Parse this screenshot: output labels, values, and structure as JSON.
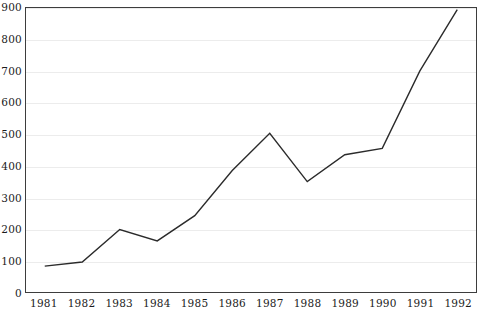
{
  "chart_data": {
    "type": "line",
    "title": "",
    "subtitle": "",
    "xlabel": "",
    "ylabel": "",
    "categories": [
      "1981",
      "1982",
      "1983",
      "1984",
      "1985",
      "1986",
      "1987",
      "1988",
      "1989",
      "1990",
      "1991",
      "1992"
    ],
    "x": [
      1981,
      1982,
      1983,
      1984,
      1985,
      1986,
      1987,
      1988,
      1989,
      1990,
      1991,
      1992
    ],
    "values": [
      82,
      95,
      198,
      162,
      242,
      385,
      503,
      350,
      435,
      455,
      700,
      895
    ],
    "series": [
      {
        "name": "series-1",
        "values": [
          82,
          95,
          198,
          162,
          242,
          385,
          503,
          350,
          435,
          455,
          700,
          895
        ]
      }
    ],
    "ylim": [
      0,
      900
    ],
    "yticks": [
      0,
      100,
      200,
      300,
      400,
      500,
      600,
      700,
      800,
      900
    ],
    "ytick_labels": [
      "0",
      "100",
      "200",
      "300",
      "400",
      "500",
      "600",
      "700",
      "800",
      "900"
    ],
    "xtick_labels": [
      "1981",
      "1982",
      "1983",
      "1984",
      "1985",
      "1986",
      "1987",
      "1988",
      "1989",
      "1990",
      "1991",
      "1992"
    ],
    "grid": "horizontal",
    "legend": "none",
    "annotations": [],
    "colors": {
      "line": "#2b2b2b",
      "grid": "#ececec",
      "frame": "#3d3d3d",
      "background": "#ffffff",
      "tick_text": "#1b1b1b"
    }
  }
}
